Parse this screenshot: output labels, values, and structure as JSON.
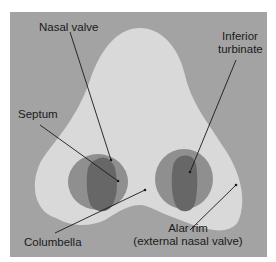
{
  "figure": {
    "type": "anatomical-diagram",
    "colors": {
      "background_panel": "#a3a3a3",
      "nose_skin": "#d9d9d9",
      "nostril_outer": "#8f8f8f",
      "nostril_inner": "#676767",
      "leader_line": "#1a1a1a",
      "label_text": "#1a1a1a"
    }
  },
  "labels": {
    "nasal_valve": "Nasal valve",
    "inferior_turbinate_line1": "Inferior",
    "inferior_turbinate_line2": "turbinate",
    "septum": "Septum",
    "columbella": "Columbella",
    "alar_rim_line1": "Alar rim",
    "alar_rim_line2": "(external nasal valve)"
  }
}
